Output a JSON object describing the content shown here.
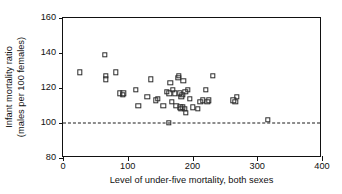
{
  "chart_data": {
    "type": "scatter",
    "title": "",
    "xlabel": "Level of under-five mortality, both sexes",
    "ylabel_line1": "Infant mortality ratio",
    "ylabel_line2": "(males per 100 females)",
    "xlim": [
      0,
      400
    ],
    "ylim": [
      80,
      160
    ],
    "xticks": [
      0,
      100,
      200,
      300,
      400
    ],
    "yticks": [
      80,
      100,
      120,
      140,
      160
    ],
    "xtick_labels": [
      "0",
      "100",
      "200",
      "300",
      "400"
    ],
    "ytick_labels": [
      "80",
      "100",
      "120",
      "140",
      "160"
    ],
    "grid": false,
    "legend": null,
    "marker": "open-square",
    "marker_color": "#2b2b2b",
    "reference_line": {
      "orientation": "horizontal",
      "y": 100,
      "style": "dashed",
      "color": "#1a1a1a"
    },
    "series": [
      {
        "name": "countries",
        "points": [
          [
            26,
            129
          ],
          [
            65,
            139
          ],
          [
            66,
            127
          ],
          [
            66,
            125
          ],
          [
            82,
            129
          ],
          [
            88,
            117
          ],
          [
            92,
            116
          ],
          [
            93,
            117
          ],
          [
            112,
            119
          ],
          [
            116,
            110
          ],
          [
            130,
            115
          ],
          [
            136,
            125
          ],
          [
            143,
            113
          ],
          [
            146,
            114
          ],
          [
            155,
            110
          ],
          [
            160,
            118
          ],
          [
            163,
            100
          ],
          [
            164,
            117
          ],
          [
            166,
            123
          ],
          [
            168,
            112
          ],
          [
            170,
            119
          ],
          [
            173,
            117
          ],
          [
            175,
            110
          ],
          [
            178,
            126
          ],
          [
            179,
            127
          ],
          [
            180,
            117
          ],
          [
            181,
            109
          ],
          [
            182,
            108
          ],
          [
            183,
            115
          ],
          [
            184,
            116
          ],
          [
            185,
            109
          ],
          [
            186,
            124
          ],
          [
            188,
            108
          ],
          [
            189,
            118
          ],
          [
            190,
            106
          ],
          [
            193,
            119
          ],
          [
            196,
            114
          ],
          [
            200,
            109
          ],
          [
            208,
            108
          ],
          [
            212,
            112
          ],
          [
            216,
            113
          ],
          [
            221,
            119
          ],
          [
            223,
            112
          ],
          [
            225,
            113
          ],
          [
            231,
            127
          ],
          [
            263,
            113
          ],
          [
            266,
            112
          ],
          [
            268,
            115
          ],
          [
            316,
            102
          ]
        ]
      }
    ]
  }
}
